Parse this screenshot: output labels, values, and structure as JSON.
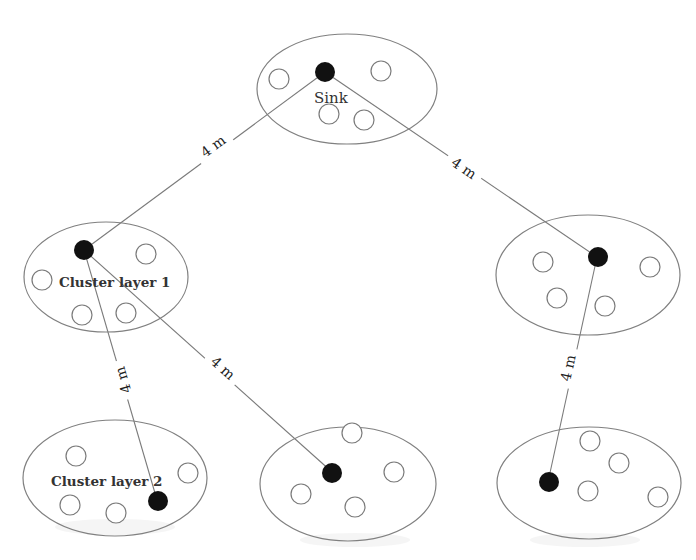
{
  "diagram": {
    "title": "",
    "labels": {
      "sink": "Sink",
      "cluster_layer_1": "Cluster  layer 1",
      "cluster_layer_2": "Cluster layer 2"
    },
    "links": [
      {
        "from": "sink",
        "to": "cluster-left-mid",
        "distance": "4 m"
      },
      {
        "from": "sink",
        "to": "cluster-right-mid",
        "distance": "4 m"
      },
      {
        "from": "cluster-left-mid",
        "to": "cluster-bottom-left",
        "distance": "4 m"
      },
      {
        "from": "cluster-left-mid",
        "to": "cluster-bottom-center",
        "distance": "4 m"
      },
      {
        "from": "cluster-right-mid",
        "to": "cluster-bottom-right",
        "distance": "4 m"
      }
    ],
    "clusters": [
      {
        "id": "sink-cluster",
        "head": "filled",
        "members": 5
      },
      {
        "id": "cluster-left-mid",
        "head": "filled",
        "members": 5
      },
      {
        "id": "cluster-right-mid",
        "head": "filled",
        "members": 5
      },
      {
        "id": "cluster-bottom-left",
        "head": "filled",
        "members": 5
      },
      {
        "id": "cluster-bottom-center",
        "head": "filled",
        "members": 5
      },
      {
        "id": "cluster-bottom-right",
        "head": "filled",
        "members": 5
      }
    ],
    "colors": {
      "head_node": "#111111",
      "member_node_stroke": "#7a7a7a",
      "cluster_stroke": "#808080",
      "link": "#7a7a7a"
    }
  }
}
